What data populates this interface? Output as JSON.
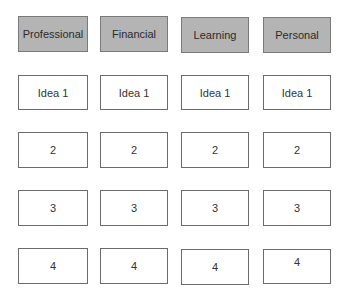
{
  "columns": [
    {
      "header": "Professional",
      "items": [
        "Idea 1",
        "2",
        "3",
        "4"
      ]
    },
    {
      "header": "Financial",
      "items": [
        "Idea 1",
        "2",
        "3",
        "4"
      ]
    },
    {
      "header": "Learning",
      "items": [
        "Idea 1",
        "2",
        "3",
        "4"
      ]
    },
    {
      "header": "Personal",
      "items": [
        "Idea 1",
        "2",
        "3",
        "4"
      ]
    }
  ],
  "colors": {
    "header_fill": "#b4b4b4",
    "border": "#6b6b6b",
    "cell_fill": "#ffffff"
  }
}
